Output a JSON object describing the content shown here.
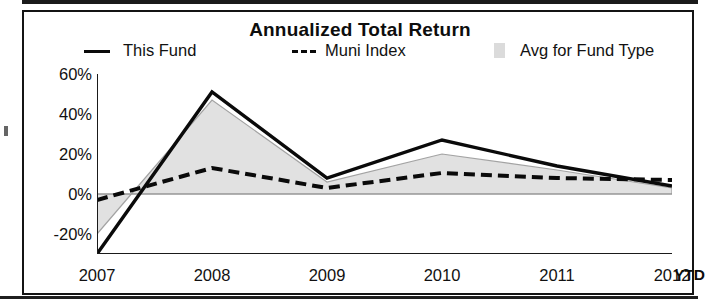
{
  "chart_data": {
    "type": "line",
    "title": "Annualized Total Return",
    "xlabel": "",
    "ylabel": "",
    "categories": [
      "2007",
      "2008",
      "2009",
      "2010",
      "2011",
      "2012"
    ],
    "x_last_suffix": "YTD",
    "ylim": [
      -30,
      60
    ],
    "yticks": [
      60,
      40,
      20,
      0,
      -20
    ],
    "ytick_labels": [
      "60%",
      "40%",
      "20%",
      "0%",
      "-20%"
    ],
    "grid": false,
    "legend_position": "top",
    "series": [
      {
        "name": "This Fund",
        "style": "solid",
        "color": "#0a0a0a",
        "values": [
          -30,
          51,
          8,
          27,
          14,
          4
        ]
      },
      {
        "name": "Muni Index",
        "style": "dashed",
        "color": "#0a0a0a",
        "values": [
          -3,
          13,
          3,
          10.5,
          8,
          7
        ]
      },
      {
        "name": "Avg for Fund Type",
        "style": "area",
        "color": "#cfcfcf",
        "values": [
          -20,
          47,
          6,
          20,
          12,
          3
        ]
      }
    ]
  },
  "chart": {
    "title": "Annualized Total Return",
    "legend": [
      {
        "label": "This Fund",
        "marker": "solid-line-swatch"
      },
      {
        "label": "Muni Index",
        "marker": "dashed-line-swatch"
      },
      {
        "label": "Avg for Fund Type",
        "marker": "area-swatch"
      }
    ],
    "y_axis": {
      "labels": [
        "60%",
        "40%",
        "20%",
        "0%",
        "-20%"
      ]
    },
    "x_axis": {
      "labels": [
        "2007",
        "2008",
        "2009",
        "2010",
        "2011",
        "2012"
      ],
      "ytd_label": "YTD"
    },
    "colors": {
      "line": "#0a0a0a",
      "area_fill": "#cfcfcf",
      "frame": "#141414",
      "background": "#ffffff"
    }
  }
}
